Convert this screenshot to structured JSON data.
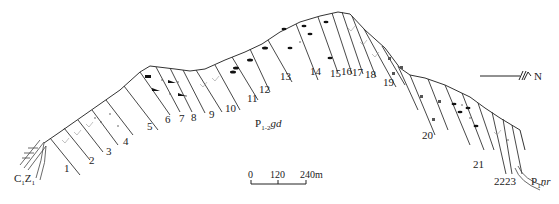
{
  "diagram": {
    "type": "geological-cross-section",
    "orientation": {
      "arrow_label": "N"
    },
    "formations": {
      "left": {
        "main": "C",
        "sub1": "1",
        "mid": "Z",
        "sub2": "1"
      },
      "center": {
        "main": "P",
        "sub": "1-2",
        "italic": "gd"
      },
      "right": {
        "main": "P",
        "sub": "1",
        "italic": "nr"
      }
    },
    "scale_bar": {
      "ticks": [
        "0",
        "120",
        "240m"
      ]
    },
    "layers": [
      {
        "id": "1",
        "x": 64,
        "y": 163
      },
      {
        "id": "2",
        "x": 89,
        "y": 155
      },
      {
        "id": "3",
        "x": 106,
        "y": 146
      },
      {
        "id": "4",
        "x": 123,
        "y": 136
      },
      {
        "id": "5",
        "x": 147,
        "y": 121
      },
      {
        "id": "6",
        "x": 165,
        "y": 114
      },
      {
        "id": "7",
        "x": 179,
        "y": 113
      },
      {
        "id": "8",
        "x": 191,
        "y": 112
      },
      {
        "id": "9",
        "x": 209,
        "y": 109
      },
      {
        "id": "10",
        "x": 225,
        "y": 103
      },
      {
        "id": "11",
        "x": 247,
        "y": 93
      },
      {
        "id": "12",
        "x": 259,
        "y": 84
      },
      {
        "id": "13",
        "x": 280,
        "y": 71
      },
      {
        "id": "14",
        "x": 310,
        "y": 66
      },
      {
        "id": "15",
        "x": 330,
        "y": 68
      },
      {
        "id": "16",
        "x": 341,
        "y": 66
      },
      {
        "id": "17",
        "x": 352,
        "y": 67
      },
      {
        "id": "18",
        "x": 365,
        "y": 69
      },
      {
        "id": "19",
        "x": 383,
        "y": 77
      },
      {
        "id": "20",
        "x": 422,
        "y": 130
      },
      {
        "id": "21",
        "x": 473,
        "y": 159
      },
      {
        "id": "22",
        "x": 494,
        "y": 176
      },
      {
        "id": "23",
        "x": 505,
        "y": 176
      }
    ]
  }
}
